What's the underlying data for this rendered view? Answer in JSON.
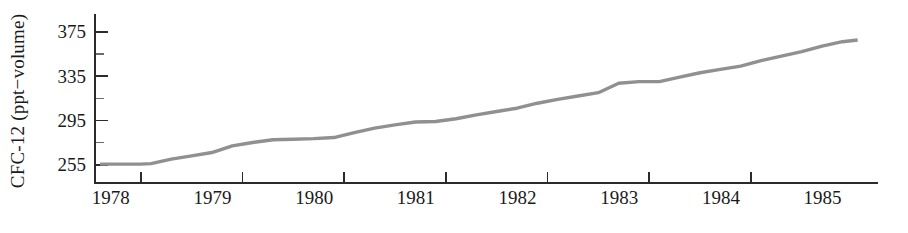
{
  "chart_data": {
    "type": "line",
    "title": "",
    "xlabel": "",
    "ylabel": "CFC-12 (ppt−volume)",
    "xlim": [
      1977.55,
      1985.25
    ],
    "ylim": [
      247.0,
      391.0
    ],
    "grid": false,
    "legend": null,
    "line_color": "#909090",
    "axis_color": "#2b2b2b",
    "x_tick_labels": [
      "1978",
      "1979",
      "1980",
      "1981",
      "1982",
      "1983",
      "1984",
      "1985"
    ],
    "x_tick_values": [
      1978,
      1979,
      1980,
      1981,
      1982,
      1983,
      1984,
      1985
    ],
    "y_tick_labels": [
      "255",
      "295",
      "335",
      "375"
    ],
    "y_tick_values": [
      255,
      295,
      335,
      375
    ],
    "y_minor_tick_values": [
      275,
      315,
      355
    ],
    "series": [
      {
        "name": "CFC-12",
        "x": [
          1977.6,
          1977.8,
          1978.0,
          1978.1,
          1978.3,
          1978.5,
          1978.7,
          1978.9,
          1979.1,
          1979.3,
          1979.5,
          1979.7,
          1979.9,
          1980.1,
          1980.3,
          1980.5,
          1980.7,
          1980.9,
          1981.1,
          1981.3,
          1981.5,
          1981.7,
          1981.9,
          1982.1,
          1982.3,
          1982.5,
          1982.7,
          1982.9,
          1983.1,
          1983.3,
          1983.5,
          1983.7,
          1983.9,
          1984.1,
          1984.3,
          1984.5,
          1984.7,
          1984.9,
          1985.05
        ],
        "y": [
          255.5,
          255.5,
          255.5,
          256.0,
          260.0,
          263.0,
          266.0,
          272.0,
          275.0,
          277.5,
          278.0,
          278.5,
          279.5,
          284.0,
          288.0,
          291.0,
          293.5,
          294.0,
          296.5,
          300.0,
          303.0,
          306.0,
          310.5,
          314.0,
          317.0,
          320.0,
          328.5,
          330.0,
          330.0,
          334.0,
          338.0,
          341.0,
          344.0,
          349.0,
          353.0,
          357.0,
          362.0,
          366.0,
          367.5
        ]
      }
    ]
  },
  "axes_geometry": {
    "plot_left": 95,
    "plot_right": 878,
    "plot_top": 14,
    "plot_bottom": 183,
    "y_value_top": 391.0,
    "y_value_bottom": 238.5,
    "x_value_left": 1977.55,
    "x_value_right": 1985.25,
    "tick_major_len": 13,
    "tick_minor_len": 9,
    "x_tick_len": 11
  }
}
